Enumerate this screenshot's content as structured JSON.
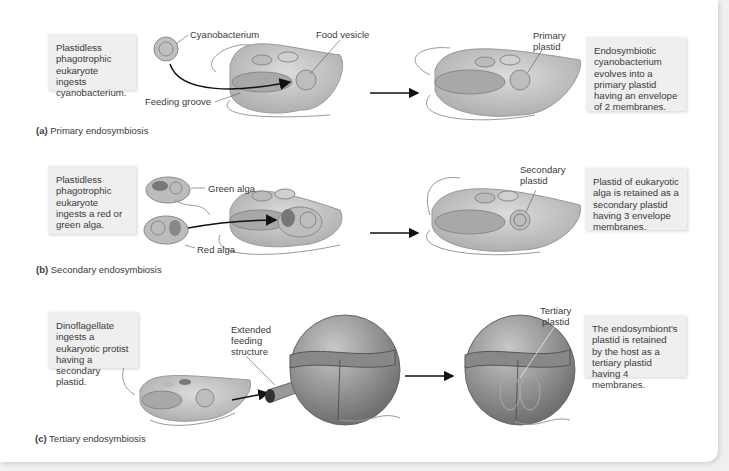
{
  "figure": {
    "panels": [
      {
        "id": "a",
        "caption_letter": "(a)",
        "caption_text": "Primary endosymbiosis",
        "left_box": "Plastidless phagotrophic eukaryote ingests cyanobacterium.",
        "right_box": "Endosymbiotic cyanobacterium evolves into a primary plastid having an envelope of 2 membranes.",
        "labels": {
          "cyanobacterium": "Cyanobacterium",
          "food_vesicle": "Food vesicle",
          "feeding_groove": "Feeding groove",
          "primary_plastid_1": "Primary",
          "primary_plastid_2": "plastid"
        }
      },
      {
        "id": "b",
        "caption_letter": "(b)",
        "caption_text": "Secondary endosymbiosis",
        "left_box": "Plastidless phagotrophic eukaryote ingests a red or green alga.",
        "right_box": "Plastid of eukaryotic alga is retained as a secondary plastid having 3 envelope membranes.",
        "labels": {
          "green_alga": "Green alga",
          "red_alga": "Red alga",
          "secondary_plastid_1": "Secondary",
          "secondary_plastid_2": "plastid"
        }
      },
      {
        "id": "c",
        "caption_letter": "(c)",
        "caption_text": "Tertiary endosymbiosis",
        "left_box": "Dinoflagellate ingests a eukaryotic protist having a secondary plastid.",
        "right_box": "The endosymbiont's plastid is retained by the host as a tertiary plastid having 4 membranes.",
        "labels": {
          "extended_1": "Extended",
          "extended_2": "feeding",
          "extended_3": "structure",
          "tertiary_plastid_1": "Tertiary",
          "tertiary_plastid_2": "plastid"
        }
      }
    ],
    "colors": {
      "background": "#f0f0f0",
      "panel": "#ffffff",
      "infobox": "#efefef",
      "cell_fill": "#c9c9c9",
      "arrow": "#111111"
    }
  }
}
